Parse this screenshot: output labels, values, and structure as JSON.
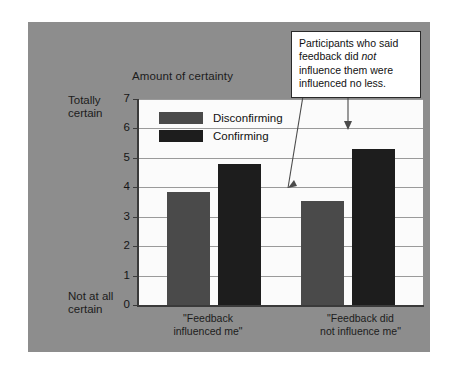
{
  "chart_data": {
    "type": "bar",
    "title": "",
    "ylabel": "Amount of certainty",
    "xlabel": "",
    "categories": [
      "\"Feedback\ninfluenced me\"",
      "\"Feedback did\nnot influence me\""
    ],
    "series": [
      {
        "name": "Disconfirming",
        "values": [
          3.85,
          3.55
        ],
        "color": "#4a4a4a"
      },
      {
        "name": "Confirming",
        "values": [
          4.78,
          5.29
        ],
        "color": "#1d1d1d"
      }
    ],
    "ylim": [
      0,
      7
    ],
    "yticks": [
      0,
      1,
      2,
      3,
      4,
      5,
      6,
      7
    ],
    "grid": true,
    "legend_position": "upper-left-inside",
    "y_anchor_high": "Totally\ncertain",
    "y_anchor_low": "Not at all\ncertain",
    "annotations": [
      {
        "text_prefix": "Participants who said feedback did ",
        "text_italic": "not",
        "text_suffix": " influence them were influenced no less.",
        "points_to": [
          "Disconfirming bar of \"Feedback did not influence me\"",
          "Confirming bar of \"Feedback did not influence me\""
        ]
      }
    ]
  },
  "legend": {
    "items": [
      {
        "label": "Disconfirming"
      },
      {
        "label": "Confirming"
      }
    ]
  },
  "axis": {
    "title": "Amount of certainty",
    "ticks": [
      "7",
      "6",
      "5",
      "4",
      "3",
      "2",
      "1",
      "0"
    ],
    "anchor_top": "Totally\ncertain",
    "anchor_bottom": "Not at all\ncertain"
  },
  "xlabels": [
    "\"Feedback\ninfluenced me\"",
    "\"Feedback did\nnot influence me\""
  ],
  "callout": {
    "prefix": "Participants who said feedback did ",
    "emphasis": "not",
    "suffix": " influence them were influenced no less."
  },
  "colors": {
    "panel_background": "#8d8d8d",
    "plot_background": "#fbfbfb",
    "disconfirming": "#4a4a4a",
    "confirming": "#1d1d1d",
    "gridline": "#9a9a9a",
    "axis": "#3a3a3a"
  }
}
